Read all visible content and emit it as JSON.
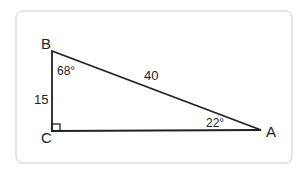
{
  "diagram": {
    "type": "right-triangle",
    "vertices": {
      "A": {
        "label": "A"
      },
      "B": {
        "label": "B"
      },
      "C": {
        "label": "C"
      }
    },
    "sides": {
      "BC": "15",
      "AB": "40"
    },
    "angles": {
      "B": "68°",
      "A": "22°",
      "C": "right-angle"
    },
    "colors": {
      "stroke": "#222222",
      "frame": "#cccccc"
    }
  }
}
